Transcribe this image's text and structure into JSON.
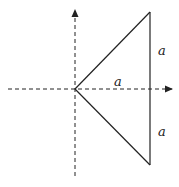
{
  "diagram": {
    "axes": {
      "x_axis": {
        "x1": 8,
        "y": 89,
        "x2": 174,
        "style": "dashed",
        "arrow": "right"
      },
      "y_axis": {
        "x": 75,
        "y1": 8,
        "y2": 176,
        "style": "dashed",
        "arrow": "up"
      }
    },
    "triangle": {
      "origin": [
        75,
        89
      ],
      "top_vertex": [
        150,
        12
      ],
      "bottom_vertex": [
        150,
        165
      ]
    },
    "labels": {
      "upper_side": "a",
      "lower_side": "a",
      "horizontal_distance": "a"
    },
    "colors": {
      "line": "#222222",
      "background": "#ffffff"
    }
  }
}
